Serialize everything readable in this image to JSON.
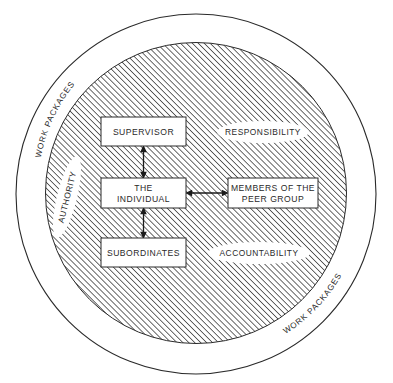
{
  "diagram": {
    "colors": {
      "line": "#2a2a2a",
      "hatch": "#3a3a3a",
      "fill": "#ffffff"
    },
    "outer_ring": {
      "labels": [
        "WORK PACKAGES",
        "WORK PACKAGES"
      ]
    },
    "boxes": {
      "supervisor": "SUPERVISOR",
      "individual_line1": "THE",
      "individual_line2": "INDIVIDUAL",
      "subordinates": "SUBORDINATES",
      "peer_line1": "MEMBERS OF THE",
      "peer_line2": "PEER GROUP"
    },
    "ovals": {
      "responsibility": "RESPONSIBILITY",
      "accountability": "ACCOUNTABILITY",
      "authority": "AUTHORITY"
    },
    "connections": [
      {
        "from": "supervisor",
        "to": "individual",
        "type": "double-arrow"
      },
      {
        "from": "individual",
        "to": "subordinates",
        "type": "double-arrow"
      },
      {
        "from": "individual",
        "to": "peer_group",
        "type": "double-arrow"
      }
    ]
  }
}
